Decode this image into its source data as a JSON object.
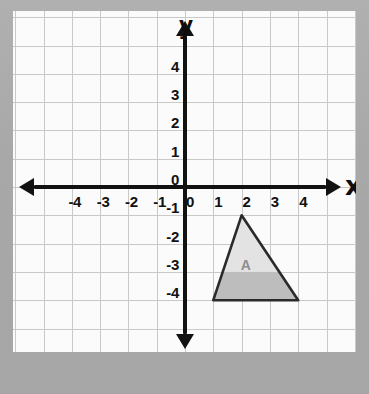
{
  "figure": {
    "type": "coordinate-plane",
    "axis_titles": {
      "x": "x",
      "y": "y"
    },
    "x_tick_labels": [
      "-4",
      "-3",
      "-2",
      "-1",
      "0",
      "1",
      "2",
      "3",
      "4"
    ],
    "x_tick_values": [
      -4,
      -3,
      -2,
      -1,
      0,
      1,
      2,
      3,
      4
    ],
    "y_tick_labels": [
      "4",
      "3",
      "2",
      "1",
      "0",
      "-1",
      "-2",
      "-3",
      "-4"
    ],
    "y_tick_values": [
      4,
      3,
      2,
      1,
      0,
      -1,
      -2,
      -3,
      -4
    ],
    "xlim": [
      -5,
      5
    ],
    "ylim": [
      -5,
      5
    ],
    "grid": true,
    "grid_color": "#c9c9c9",
    "axis_color": "#121212",
    "sheet_color": "#fbfbfb",
    "border_color": "#a9a9a9"
  },
  "chart_data": {
    "type": "scatter",
    "title": "",
    "xlabel": "x",
    "ylabel": "y",
    "xlim": [
      -5,
      5
    ],
    "ylim": [
      -5,
      5
    ],
    "grid": true,
    "x_ticks": [
      -4,
      -3,
      -2,
      -1,
      0,
      1,
      2,
      3,
      4
    ],
    "y_ticks": [
      -4,
      -3,
      -2,
      -1,
      0,
      1,
      2,
      3,
      4
    ],
    "shapes": [
      {
        "name": "A",
        "label": "A",
        "kind": "triangle",
        "vertices": [
          [
            2,
            -1
          ],
          [
            1,
            -4
          ],
          [
            4,
            -4
          ]
        ],
        "fill_upper": "#e3e3e3",
        "fill_lower": "#bdbdbd",
        "stroke": "#2a2a2a",
        "label_position": [
          2.15,
          -2.75
        ]
      }
    ]
  },
  "shape_a": {
    "label": "A",
    "vertex_apex": "(2, -1)",
    "vertex_bottom_left": "(1, -4)",
    "vertex_bottom_right": "(4, -4)"
  }
}
